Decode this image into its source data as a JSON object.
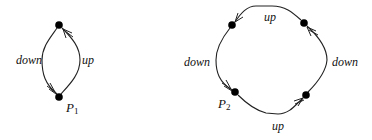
{
  "diagrams": [
    {
      "id": "P1",
      "point_label": "P",
      "point_subscript": "1",
      "nodes": [
        {
          "name": "top",
          "x": 59,
          "y": 25
        },
        {
          "name": "bottom",
          "x": 59,
          "y": 97
        }
      ],
      "edges": [
        {
          "label": "down",
          "from": "top",
          "to": "bottom",
          "side": "left"
        },
        {
          "label": "up",
          "from": "bottom",
          "to": "top",
          "side": "right"
        }
      ]
    },
    {
      "id": "P2",
      "point_label": "P",
      "point_subscript": "2",
      "nodes": [
        {
          "name": "top-left",
          "x": 232,
          "y": 25
        },
        {
          "name": "top-right",
          "x": 304,
          "y": 23
        },
        {
          "name": "bottom-right",
          "x": 306,
          "y": 95
        },
        {
          "name": "bottom-left",
          "x": 235,
          "y": 92
        }
      ],
      "edges": [
        {
          "label": "up",
          "from": "top-right",
          "to": "top-left",
          "side": "top"
        },
        {
          "label": "down",
          "from": "top-left",
          "to": "bottom-left",
          "side": "left"
        },
        {
          "label": "up",
          "from": "bottom-left",
          "to": "bottom-right",
          "side": "bottom"
        },
        {
          "label": "down",
          "from": "bottom-right",
          "to": "top-right",
          "side": "right"
        }
      ]
    }
  ],
  "labels": {
    "d1_down": "down",
    "d1_up": "up",
    "d1_p": "P",
    "d1_sub": "1",
    "d2_top_up": "up",
    "d2_left_down": "down",
    "d2_right_down": "down",
    "d2_bottom_up": "up",
    "d2_p": "P",
    "d2_sub": "2"
  }
}
